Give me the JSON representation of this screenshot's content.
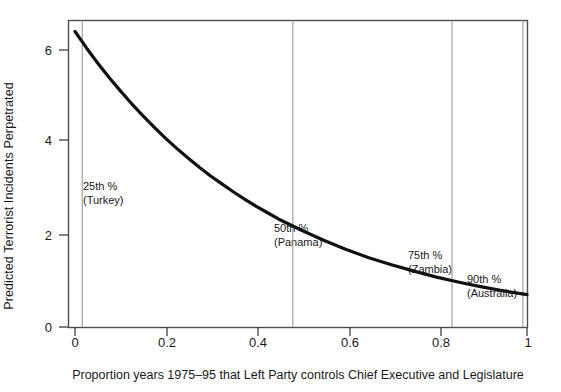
{
  "chart_data": {
    "type": "line",
    "title": "",
    "xlabel": "Proportion years 1975–95 that Left Party controls Chief Executive and Legislature",
    "ylabel": "Predicted Terrorist Incidents Perpetrated",
    "xlim": [
      0,
      1
    ],
    "ylim": [
      0,
      6.7
    ],
    "grid": false,
    "legend": "none",
    "xticks": [
      "0",
      "0.2",
      "0.4",
      "0.6",
      "0.8",
      "1"
    ],
    "xtick_values": [
      0,
      0.2,
      0.4,
      0.6,
      0.8,
      1
    ],
    "yticks": [
      "0",
      "2",
      "4",
      "6"
    ],
    "ytick_values": [
      0,
      2,
      4,
      6
    ],
    "series": [
      {
        "name": "Predicted incidents",
        "x": [
          0.0,
          0.025,
          0.05,
          0.075,
          0.1,
          0.125,
          0.15,
          0.175,
          0.2,
          0.225,
          0.25,
          0.275,
          0.3,
          0.325,
          0.35,
          0.375,
          0.4,
          0.425,
          0.45,
          0.475,
          0.5,
          0.55,
          0.6,
          0.65,
          0.7,
          0.75,
          0.8,
          0.85,
          0.9,
          0.95,
          1.0
        ],
        "y": [
          6.4,
          6.05,
          5.72,
          5.41,
          5.12,
          4.84,
          4.58,
          4.33,
          4.09,
          3.87,
          3.66,
          3.46,
          3.27,
          3.1,
          2.93,
          2.77,
          2.62,
          2.48,
          2.34,
          2.22,
          2.1,
          1.88,
          1.68,
          1.5,
          1.35,
          1.21,
          1.08,
          0.97,
          0.87,
          0.78,
          0.7
        ]
      }
    ],
    "annotations": [
      {
        "name": "percentile-25",
        "percentile": "25th %",
        "country": "(Turkey)",
        "x_value": 0.016
      },
      {
        "name": "percentile-50",
        "percentile": "50th %",
        "country": "(Panama)",
        "x_value": 0.482
      },
      {
        "name": "percentile-75",
        "percentile": "75th %",
        "country": "(Zambia)",
        "x_value": 0.834
      },
      {
        "name": "percentile-90",
        "percentile": "90th %",
        "country": "(Australia)",
        "x_value": 0.991
      }
    ],
    "colors": {
      "curve": "#111111",
      "frame": "#4d4d4d",
      "reference_line": "#9a9a9a",
      "text": "#1a1a1a",
      "background": "#ffffff"
    }
  }
}
